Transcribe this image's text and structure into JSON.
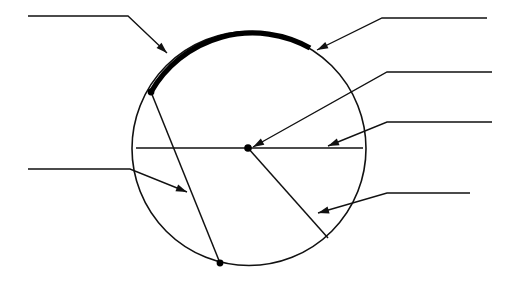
{
  "figure": {
    "type": "geometry-diagram",
    "canvas": {
      "width": 505,
      "height": 282
    },
    "background_color": "#ffffff",
    "line_color": "#111111",
    "highlight_color": "#000000"
  },
  "circle": {
    "name": "circle-outline",
    "center_x": 249,
    "center_y": 148.5,
    "radius": 117,
    "stroke_width": 1.6
  },
  "highlight_arc": {
    "name": "arc-highlight",
    "start_x": 151,
    "start_y": 92,
    "end_x": 310,
    "end_y": 48,
    "stroke_width": 5.2,
    "path": "M 151 92 A 117 117 0 0 1 310 48"
  },
  "segments": {
    "diameter": {
      "x1": 136,
      "y1": 148,
      "x2": 363,
      "y2": 148
    },
    "chord": {
      "x1": 151,
      "y1": 92,
      "x2": 220,
      "y2": 263
    },
    "radius": {
      "x1": 248,
      "y1": 148,
      "x2": 328,
      "y2": 238
    }
  },
  "points": [
    {
      "name": "arc-endpoint-upper",
      "x": 151,
      "y": 92,
      "r": 3.4
    },
    {
      "name": "circle-center-point",
      "x": 248,
      "y": 148,
      "r": 3.8
    },
    {
      "name": "chord-endpoint-lower",
      "x": 220,
      "y": 263,
      "r": 3.4
    }
  ],
  "leaders": [
    {
      "id": "leader-arc",
      "name": "leader-line-arc",
      "label": "",
      "side": "left",
      "path": "M 28 16 L 128 16 L 167 53",
      "tip_x": 167,
      "tip_y": 53,
      "angle_deg": 43.5,
      "label_x": 32,
      "label_y": 12
    },
    {
      "id": "leader-circumference",
      "name": "leader-line-circumference",
      "label": "",
      "side": "right",
      "path": "M 487 18 L 382 18 L 317 50",
      "tip_x": 317,
      "tip_y": 50,
      "angle_deg": 153.8,
      "label_x": 392,
      "label_y": 14
    },
    {
      "id": "leader-radius",
      "name": "leader-line-radius",
      "label": "",
      "side": "right",
      "path": "M 492 72 L 387 72 L 253 147",
      "tip_x": 253,
      "tip_y": 147,
      "angle_deg": 150.8,
      "label_x": 394,
      "label_y": 68
    },
    {
      "id": "leader-diameter",
      "name": "leader-line-diameter",
      "label": "",
      "side": "right",
      "path": "M 492 122 L 387 122 L 328 146",
      "tip_x": 328,
      "tip_y": 146,
      "angle_deg": 157.9,
      "label_x": 394,
      "label_y": 118
    },
    {
      "id": "leader-sector",
      "name": "leader-line-sector",
      "label": "",
      "side": "right",
      "path": "M 470 193 L 387 193 L 318 213",
      "tip_x": 318,
      "tip_y": 213,
      "angle_deg": 163.8,
      "label_x": 394,
      "label_y": 189
    },
    {
      "id": "leader-chord",
      "name": "leader-line-chord",
      "label": "",
      "side": "left",
      "path": "M 28 169 L 130 169 L 187 192",
      "tip_x": 187,
      "tip_y": 192,
      "angle_deg": 22.0,
      "label_x": 32,
      "label_y": 165
    }
  ]
}
